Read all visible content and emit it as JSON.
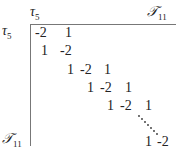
{
  "matrix": {
    "top_left_col_label": "τ",
    "top_left_col_sub": "5",
    "top_right_col_label": "𝒯",
    "top_right_col_sub": "11",
    "row_top_label": "τ",
    "row_top_sub": "5",
    "row_bottom_label": "𝒯",
    "row_bottom_sub": "11",
    "cells": [
      {
        "v": "-2",
        "x": 35,
        "y": 26
      },
      {
        "v": "1",
        "x": 65,
        "y": 26
      },
      {
        "v": "1",
        "x": 41,
        "y": 44
      },
      {
        "v": "-2",
        "x": 60,
        "y": 44
      },
      {
        "v": "1",
        "x": 67,
        "y": 63
      },
      {
        "v": "-2",
        "x": 80,
        "y": 63
      },
      {
        "v": "1",
        "x": 104,
        "y": 63
      },
      {
        "v": "1",
        "x": 87,
        "y": 81
      },
      {
        "v": "-2",
        "x": 100,
        "y": 81
      },
      {
        "v": "1",
        "x": 125,
        "y": 81
      },
      {
        "v": "1",
        "x": 107,
        "y": 99
      },
      {
        "v": "-2",
        "x": 120,
        "y": 99
      },
      {
        "v": "1",
        "x": 145,
        "y": 99
      },
      {
        "v": "1",
        "x": 145,
        "y": 135
      },
      {
        "v": "-2",
        "x": 157,
        "y": 135
      }
    ]
  }
}
